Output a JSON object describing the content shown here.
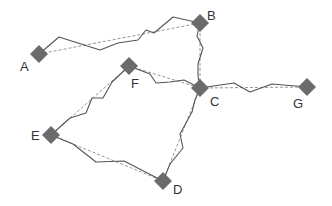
{
  "diagram": {
    "type": "network-graph",
    "colors": {
      "node": "#6b6b6b",
      "route": "#555555",
      "straight": "#8a8a8a",
      "label": "#333333"
    },
    "nodes": [
      {
        "id": "A",
        "label": "A"
      },
      {
        "id": "B",
        "label": "B"
      },
      {
        "id": "C",
        "label": "C"
      },
      {
        "id": "D",
        "label": "D"
      },
      {
        "id": "E",
        "label": "E"
      },
      {
        "id": "F",
        "label": "F"
      },
      {
        "id": "G",
        "label": "G"
      }
    ],
    "edges": [
      {
        "from": "A",
        "to": "B",
        "style": [
          "straight-dashed",
          "jagged-solid"
        ]
      },
      {
        "from": "B",
        "to": "C",
        "style": [
          "straight-dashed",
          "jagged-solid"
        ]
      },
      {
        "from": "F",
        "to": "C",
        "style": [
          "straight-dashed",
          "jagged-solid"
        ]
      },
      {
        "from": "C",
        "to": "G",
        "style": [
          "straight-dashed",
          "jagged-solid"
        ]
      },
      {
        "from": "C",
        "to": "D",
        "style": [
          "straight-dashed",
          "jagged-solid"
        ]
      },
      {
        "from": "E",
        "to": "F",
        "style": [
          "straight-dashed",
          "jagged-solid"
        ]
      },
      {
        "from": "E",
        "to": "D",
        "style": [
          "straight-dashed",
          "jagged-solid"
        ]
      }
    ],
    "legend": {
      "straight_dashed": "direct link",
      "jagged_solid": "actual route"
    }
  }
}
